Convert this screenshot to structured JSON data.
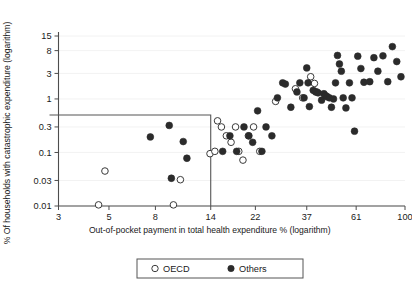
{
  "chart_data": {
    "type": "scatter",
    "title": "",
    "xlabel": "Out-of-pocket payment in total health expenditure  % (logarithm)",
    "ylabel": "% Of households with catastrophic expenditure (logarithm)",
    "xscale": "log",
    "yscale": "log",
    "xlim": [
      3,
      100
    ],
    "ylim": [
      0.01,
      15
    ],
    "xticks": [
      3,
      5,
      8,
      14,
      22,
      37,
      61,
      100
    ],
    "xtick_labels": [
      "3",
      "5",
      "8",
      "14",
      "22",
      "37",
      "61",
      "100"
    ],
    "yticks": [
      0.01,
      0.03,
      0.1,
      0.3,
      1,
      3,
      8,
      15
    ],
    "ytick_labels": [
      "0.01",
      "0.03",
      "0.1",
      "0.3",
      "1",
      "3",
      "8",
      "15"
    ],
    "grid": true,
    "legend_position": "bottom-center",
    "annotation_box": {
      "label": "low-payment low-catastrophe region",
      "x_range": [
        3,
        14
      ],
      "y_range": [
        0.01,
        0.5
      ]
    },
    "series": [
      {
        "name": "OECD",
        "marker": "open-circle",
        "color": "#ffffff",
        "edge_color": "#3a3a3a",
        "points": [
          [
            4.5,
            0.0105
          ],
          [
            4.8,
            0.045
          ],
          [
            9.6,
            0.0105
          ],
          [
            10.3,
            0.031
          ],
          [
            13.9,
            0.095
          ],
          [
            14.6,
            0.105
          ],
          [
            15.0,
            0.39
          ],
          [
            15.6,
            0.3
          ],
          [
            16.4,
            0.205
          ],
          [
            17.2,
            0.155
          ],
          [
            18.0,
            0.3
          ],
          [
            18.6,
            0.105
          ],
          [
            19.4,
            0.072
          ],
          [
            20.5,
            0.205
          ],
          [
            21.6,
            0.3
          ],
          [
            23.0,
            0.105
          ],
          [
            27.0,
            0.9
          ],
          [
            33.0,
            1.55
          ],
          [
            35.5,
            1.05
          ],
          [
            38.5,
            2.6
          ],
          [
            40.0,
            1.95
          ],
          [
            41.0,
            1.35
          ]
        ]
      },
      {
        "name": "Others",
        "marker": "filled-circle",
        "color": "#2b2b2b",
        "points": [
          [
            7.6,
            0.195
          ],
          [
            9.2,
            0.32
          ],
          [
            9.4,
            0.033
          ],
          [
            10.6,
            0.16
          ],
          [
            11.0,
            0.078
          ],
          [
            15.8,
            0.105
          ],
          [
            17.0,
            0.205
          ],
          [
            18.2,
            0.105
          ],
          [
            19.6,
            0.3
          ],
          [
            20.6,
            0.205
          ],
          [
            21.4,
            0.155
          ],
          [
            22.5,
            0.6
          ],
          [
            23.5,
            0.105
          ],
          [
            24.5,
            0.3
          ],
          [
            26.0,
            0.205
          ],
          [
            27.5,
            1.05
          ],
          [
            29.0,
            2.0
          ],
          [
            29.8,
            1.9
          ],
          [
            31.5,
            0.7
          ],
          [
            33.5,
            1.35
          ],
          [
            34.5,
            2.0
          ],
          [
            36.0,
            1.05
          ],
          [
            37.0,
            3.8
          ],
          [
            37.5,
            2.0
          ],
          [
            38.0,
            0.72
          ],
          [
            39.5,
            1.45
          ],
          [
            40.5,
            1.35
          ],
          [
            41.5,
            1.3
          ],
          [
            43.0,
            0.95
          ],
          [
            44.0,
            1.25
          ],
          [
            44.8,
            1.15
          ],
          [
            45.5,
            1.1
          ],
          [
            46.5,
            1.05
          ],
          [
            47.5,
            0.7
          ],
          [
            48.5,
            1.0
          ],
          [
            49.5,
            2.0
          ],
          [
            50.5,
            6.5
          ],
          [
            51.5,
            4.5
          ],
          [
            52.5,
            3.3
          ],
          [
            53.5,
            1.05
          ],
          [
            55.0,
            0.68
          ],
          [
            57.0,
            2.0
          ],
          [
            58.5,
            1.05
          ],
          [
            60.0,
            0.25
          ],
          [
            62.0,
            6.3
          ],
          [
            64.0,
            3.7
          ],
          [
            66.0,
            2.05
          ],
          [
            70.0,
            2.1
          ],
          [
            73.0,
            5.9
          ],
          [
            76.0,
            3.3
          ],
          [
            80.0,
            6.4
          ],
          [
            84.0,
            2.1
          ],
          [
            88.0,
            9.5
          ],
          [
            92.0,
            5.0
          ],
          [
            96.0,
            2.6
          ]
        ]
      }
    ]
  },
  "legend": {
    "items": [
      {
        "label": "OECD",
        "marker": "open-circle"
      },
      {
        "label": "Others",
        "marker": "filled-circle"
      }
    ]
  }
}
